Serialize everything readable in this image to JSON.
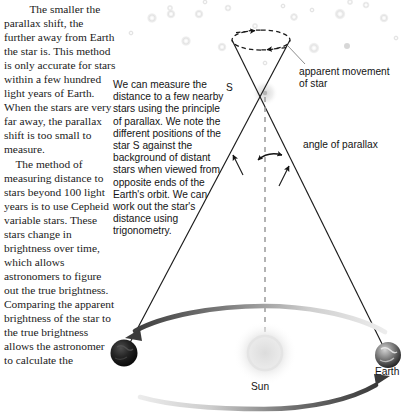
{
  "page": {
    "width": 405,
    "height": 412,
    "background": "#ffffff"
  },
  "body_text": {
    "left_column": "    The smaller the parallax shift, the further away from Earth the star is. This method is only accurate for stars within a few hundred light years of Earth. When the stars are very far away, the parallax shift is too small to measure.\n    The method of measuring distance to stars beyond 100 light years is to use Cepheid variable stars. These stars change in brightness over time, which allows astronomers to figure out the true brightness. Comparing the apparent brightness of the star to the true brightness allows the astronomer to calculate the",
    "middle_column": "We can measure the distance to a few nearby stars using the principle of parallax. We note the different positions of the star S against the background of distant stars when viewed from opposite ends of the Earth's orbit. We can work out the star's distance using trigonometry."
  },
  "diagram": {
    "labels": {
      "apparent_movement": "apparent movement\nof star",
      "angle_of_parallax": "angle of parallax",
      "star": "S",
      "sun": "Sun",
      "earth": "Earth"
    },
    "colors": {
      "line": "#1a1a1a",
      "dashed": "#1a1a1a",
      "orbit_arrow_dark": "#4a4a4a",
      "orbit_arrow_light": "#d8d8d8",
      "sun_glow": "#e9e9e9",
      "background_star": "#e2e2e2",
      "earth_dark": "#141414",
      "earth_light": "#8f8f8f"
    },
    "background_stars": [
      {
        "cx": 152,
        "cy": 18,
        "r": 5.5
      },
      {
        "cx": 170,
        "cy": 8,
        "r": 3.5
      },
      {
        "cx": 171,
        "cy": 14,
        "r": 5.0
      },
      {
        "cx": 199,
        "cy": 14,
        "r": 5.0
      },
      {
        "cx": 186,
        "cy": 41,
        "r": 5.5
      },
      {
        "cx": 222,
        "cy": 47,
        "r": 5.0
      },
      {
        "cx": 228,
        "cy": 8,
        "r": 4.0
      },
      {
        "cx": 205,
        "cy": 2,
        "r": 3.0
      },
      {
        "cx": 255,
        "cy": 26,
        "r": 3.5
      },
      {
        "cx": 294,
        "cy": 17,
        "r": 4.5
      },
      {
        "cx": 283,
        "cy": 6,
        "r": 3.0
      },
      {
        "cx": 312,
        "cy": 10,
        "r": 3.0
      },
      {
        "cx": 340,
        "cy": 14,
        "r": 6.0
      },
      {
        "cx": 350,
        "cy": 2,
        "r": 3.5
      },
      {
        "cx": 366,
        "cy": 5,
        "r": 4.0
      },
      {
        "cx": 384,
        "cy": 18,
        "r": 5.0
      },
      {
        "cx": 314,
        "cy": 48,
        "r": 6.0
      },
      {
        "cx": 347,
        "cy": 46,
        "r": 3.0
      },
      {
        "cx": 396,
        "cy": 38,
        "r": 3.0
      },
      {
        "cx": 131,
        "cy": 33,
        "r": 3.0
      },
      {
        "cx": 265,
        "cy": 63,
        "r": 3.0
      }
    ],
    "apparent_ellipse": {
      "cx": 261,
      "cy": 40,
      "rx": 29,
      "ry": 10
    },
    "star_position": {
      "x": 265,
      "y": 93
    },
    "sun_position": {
      "x": 265,
      "y": 353
    },
    "earth_left_position": {
      "x": 124,
      "y": 353
    },
    "earth_right_position": {
      "x": 388,
      "y": 355
    },
    "orbit_ellipse": {
      "cx": 264,
      "cy": 355,
      "rx": 132,
      "ry": 47
    }
  }
}
